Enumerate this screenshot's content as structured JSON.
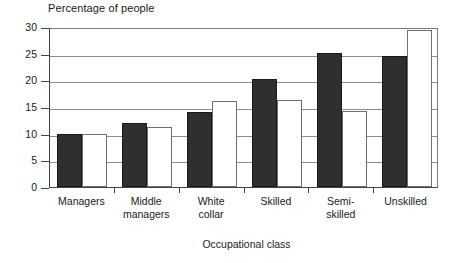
{
  "chart_data": {
    "type": "bar",
    "title": "",
    "ylabel": "Percentage of people",
    "xlabel": "Occupational class",
    "categories": [
      "Managers",
      "Middle managers",
      "White collar",
      "Skilled",
      "Semi-skilled",
      "Unskilled"
    ],
    "category_lines": [
      [
        "Managers"
      ],
      [
        "Middle",
        "managers"
      ],
      [
        "White",
        "collar"
      ],
      [
        "Skilled"
      ],
      [
        "Semi-",
        "skilled"
      ],
      [
        "Unskilled"
      ]
    ],
    "series": [
      {
        "name": "dark",
        "color": "#2f2f2f",
        "values": [
          10.0,
          12.0,
          14.0,
          20.2,
          25.2,
          24.5
        ]
      },
      {
        "name": "light",
        "color": "#ffffff",
        "values": [
          10.0,
          11.2,
          16.2,
          16.3,
          14.2,
          29.5
        ]
      }
    ],
    "ylim": [
      0,
      30
    ],
    "yticks": [
      0,
      5,
      10,
      15,
      20,
      25,
      30
    ],
    "ytick_labels": [
      "0",
      "5",
      "10",
      "15",
      "20",
      "25",
      "30"
    ],
    "grid": true,
    "legend": "none"
  }
}
